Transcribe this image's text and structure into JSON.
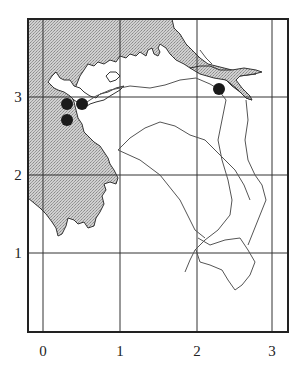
{
  "map": {
    "x_ticks": [
      "0",
      "1",
      "2",
      "3"
    ],
    "y_ticks": [
      "1",
      "2",
      "3"
    ],
    "grid": true,
    "colors": {
      "land_hatch": "#bdbdbd",
      "water": "#ffffff",
      "frame": "#222222",
      "dots": "#1a1a1a",
      "rivers": "#555555"
    },
    "points": [
      {
        "x": 0.3,
        "y": 2.9
      },
      {
        "x": 0.5,
        "y": 2.9
      },
      {
        "x": 0.3,
        "y": 2.7
      },
      {
        "x": 2.3,
        "y": 3.1
      }
    ]
  }
}
